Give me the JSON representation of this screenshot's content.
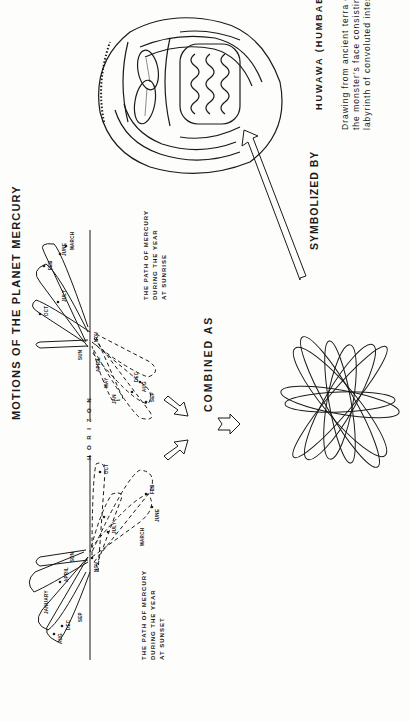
{
  "title": "MOTIONS OF THE PLANET MERCURY",
  "horizon_label": "H O R I Z O N",
  "sunset_diagram": {
    "caption": "THE PATH OF MERCURY\nDURING THE YEAR\nAT SUNSET",
    "labels": [
      "AUG",
      "DEC",
      "SEP",
      "JANUARY",
      "APRIL",
      "SUN",
      "NOV",
      "JULY",
      "OCT",
      "MARCH",
      "JUNE",
      "FEB"
    ]
  },
  "sunrise_diagram": {
    "caption": "THE PATH OF MERCURY\nDURING THE YEAR\nAT SUNRISE",
    "labels": [
      "OCT",
      "FEB",
      "JUNE",
      "MARCH",
      "JULY",
      "SUN",
      "NOV",
      "APRIL",
      "MAY",
      "JAN",
      "DEC",
      "AUG",
      "SEP"
    ]
  },
  "combined_label": "COMBINED AS",
  "symbolized_label": "SYMBOLIZED BY",
  "mask": {
    "title": "HUWAWA (HUMBABA)",
    "description": "Drawing from ancient terra cotta mask,\nthe monster's face consisting of a\nlabyrinth of convoluted intestines"
  },
  "colors": {
    "ink": "#1a1a1a",
    "paper": "#fdfdfb"
  }
}
